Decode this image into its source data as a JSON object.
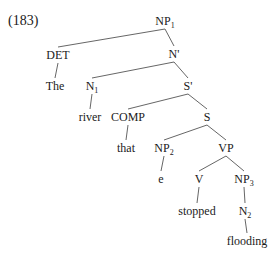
{
  "example_number": "(183)",
  "tree": {
    "nodes": [
      {
        "id": "NP1",
        "label": "NP",
        "sub": "1",
        "x": 165,
        "y": 21
      },
      {
        "id": "DET",
        "label": "DET",
        "sub": "",
        "x": 58,
        "y": 55
      },
      {
        "id": "Nbar",
        "label": "N'",
        "sub": "",
        "x": 174,
        "y": 54
      },
      {
        "id": "The",
        "label": "The",
        "sub": "",
        "x": 55,
        "y": 86
      },
      {
        "id": "N1",
        "label": "N",
        "sub": "1",
        "x": 92,
        "y": 86
      },
      {
        "id": "Sbar",
        "label": "S'",
        "sub": "",
        "x": 188,
        "y": 86
      },
      {
        "id": "river",
        "label": "river",
        "sub": "",
        "x": 90,
        "y": 117
      },
      {
        "id": "COMP",
        "label": "COMP",
        "sub": "",
        "x": 128,
        "y": 117
      },
      {
        "id": "S",
        "label": "S",
        "sub": "",
        "x": 207,
        "y": 117
      },
      {
        "id": "that",
        "label": "that",
        "sub": "",
        "x": 126,
        "y": 148
      },
      {
        "id": "NP2",
        "label": "NP",
        "sub": "2",
        "x": 164,
        "y": 148
      },
      {
        "id": "VP",
        "label": "VP",
        "sub": "",
        "x": 226,
        "y": 148
      },
      {
        "id": "e",
        "label": "e",
        "sub": "",
        "x": 161,
        "y": 179
      },
      {
        "id": "V",
        "label": "V",
        "sub": "",
        "x": 199,
        "y": 179
      },
      {
        "id": "NP3",
        "label": "NP",
        "sub": "3",
        "x": 244,
        "y": 179
      },
      {
        "id": "stopped",
        "label": "stopped",
        "sub": "",
        "x": 197,
        "y": 211
      },
      {
        "id": "N2",
        "label": "N",
        "sub": "2",
        "x": 245,
        "y": 211
      },
      {
        "id": "flooding",
        "label": "flooding",
        "sub": "",
        "x": 247,
        "y": 241
      }
    ],
    "edges": [
      [
        "NP1",
        "DET"
      ],
      [
        "NP1",
        "Nbar"
      ],
      [
        "DET",
        "The"
      ],
      [
        "Nbar",
        "N1"
      ],
      [
        "Nbar",
        "Sbar"
      ],
      [
        "N1",
        "river"
      ],
      [
        "Sbar",
        "COMP"
      ],
      [
        "Sbar",
        "S"
      ],
      [
        "COMP",
        "that"
      ],
      [
        "S",
        "NP2"
      ],
      [
        "S",
        "VP"
      ],
      [
        "NP2",
        "e"
      ],
      [
        "VP",
        "V"
      ],
      [
        "VP",
        "NP3"
      ],
      [
        "V",
        "stopped"
      ],
      [
        "NP3",
        "N2"
      ],
      [
        "N2",
        "flooding"
      ]
    ]
  }
}
